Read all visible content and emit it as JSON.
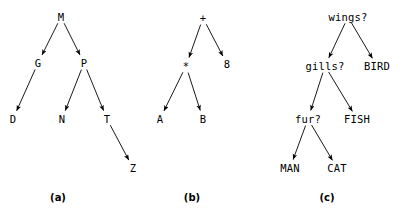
{
  "figure": {
    "width": 402,
    "height": 216,
    "background": "#ffffff",
    "ink": "#000000"
  },
  "panels": [
    {
      "id": "panel-a",
      "caption": "(a)",
      "caption_pos": {
        "x": 58,
        "y": 197
      },
      "nodes": [
        {
          "id": "M",
          "label": "M",
          "x": 61,
          "y": 17
        },
        {
          "id": "G",
          "label": "G",
          "x": 38,
          "y": 63
        },
        {
          "id": "P",
          "label": "P",
          "x": 84,
          "y": 63
        },
        {
          "id": "D",
          "label": "D",
          "x": 13,
          "y": 119
        },
        {
          "id": "N",
          "label": "N",
          "x": 62,
          "y": 119
        },
        {
          "id": "T",
          "label": "T",
          "x": 107,
          "y": 119
        },
        {
          "id": "Z",
          "label": "Z",
          "x": 133,
          "y": 168
        }
      ],
      "edges": [
        {
          "from": "M",
          "to": "G"
        },
        {
          "from": "M",
          "to": "P"
        },
        {
          "from": "G",
          "to": "D"
        },
        {
          "from": "P",
          "to": "N"
        },
        {
          "from": "P",
          "to": "T"
        },
        {
          "from": "T",
          "to": "Z"
        }
      ]
    },
    {
      "id": "panel-b",
      "caption": "(b)",
      "caption_pos": {
        "x": 192,
        "y": 197
      },
      "nodes": [
        {
          "id": "plus",
          "label": "+",
          "x": 203,
          "y": 18
        },
        {
          "id": "times",
          "label": "*",
          "x": 186,
          "y": 66
        },
        {
          "id": "eight",
          "label": "8",
          "x": 227,
          "y": 64
        },
        {
          "id": "A",
          "label": "A",
          "x": 160,
          "y": 119
        },
        {
          "id": "B",
          "label": "B",
          "x": 203,
          "y": 119
        }
      ],
      "edges": [
        {
          "from": "plus",
          "to": "times"
        },
        {
          "from": "plus",
          "to": "eight"
        },
        {
          "from": "times",
          "to": "A"
        },
        {
          "from": "times",
          "to": "B"
        }
      ]
    },
    {
      "id": "panel-c",
      "caption": "(c)",
      "caption_pos": {
        "x": 327,
        "y": 197
      },
      "nodes": [
        {
          "id": "wings",
          "label": "wings?",
          "x": 348,
          "y": 17
        },
        {
          "id": "gills",
          "label": "gills?",
          "x": 325,
          "y": 66
        },
        {
          "id": "bird",
          "label": "BIRD",
          "x": 377,
          "y": 66
        },
        {
          "id": "fur",
          "label": "fur?",
          "x": 308,
          "y": 119
        },
        {
          "id": "fish",
          "label": "FISH",
          "x": 357,
          "y": 119
        },
        {
          "id": "man",
          "label": "MAN",
          "x": 290,
          "y": 168
        },
        {
          "id": "cat",
          "label": "CAT",
          "x": 337,
          "y": 168
        }
      ],
      "edges": [
        {
          "from": "wings",
          "to": "gills"
        },
        {
          "from": "wings",
          "to": "bird"
        },
        {
          "from": "gills",
          "to": "fur"
        },
        {
          "from": "gills",
          "to": "fish"
        },
        {
          "from": "fur",
          "to": "man"
        },
        {
          "from": "fur",
          "to": "cat"
        }
      ]
    }
  ]
}
